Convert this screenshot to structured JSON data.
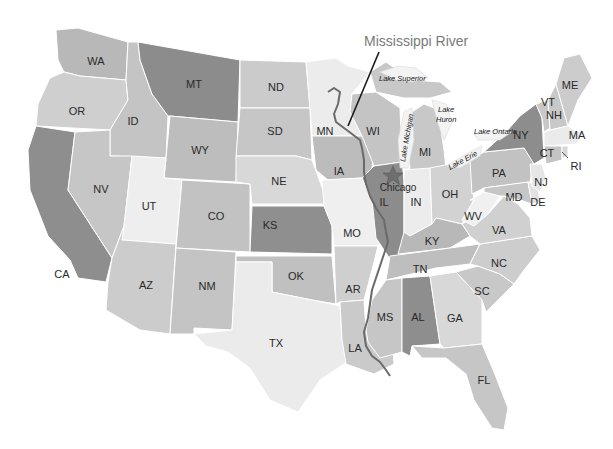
{
  "map": {
    "title": "Mississippi River",
    "city": {
      "name": "Chicago",
      "marker": "star-icon",
      "color": "#6e6e6e"
    },
    "lakes": [
      "Lake Superior",
      "Lake Huron",
      "Lake Michigan",
      "Lake Ontario",
      "Lake Erie"
    ],
    "states": {
      "WA": {
        "label": "WA",
        "fill": "#b8b8b8"
      },
      "OR": {
        "label": "OR",
        "fill": "#cfcfcf"
      },
      "CA": {
        "label": "CA",
        "fill": "#8e8e8e"
      },
      "ID": {
        "label": "ID",
        "fill": "#c4c4c4"
      },
      "NV": {
        "label": "NV",
        "fill": "#c6c6c6"
      },
      "MT": {
        "label": "MT",
        "fill": "#8c8c8c"
      },
      "WY": {
        "label": "WY",
        "fill": "#bdbdbd"
      },
      "UT": {
        "label": "UT",
        "fill": "#eeeeee"
      },
      "AZ": {
        "label": "AZ",
        "fill": "#cccccc"
      },
      "CO": {
        "label": "CO",
        "fill": "#c2c2c2"
      },
      "NM": {
        "label": "NM",
        "fill": "#c4c4c4"
      },
      "ND": {
        "label": "ND",
        "fill": "#cbcbcb"
      },
      "SD": {
        "label": "SD",
        "fill": "#c6c6c6"
      },
      "NE": {
        "label": "NE",
        "fill": "#d8d8d8"
      },
      "KS": {
        "label": "KS",
        "fill": "#8f8f8f"
      },
      "OK": {
        "label": "OK",
        "fill": "#c0c0c0"
      },
      "TX": {
        "label": "TX",
        "fill": "#ebebeb"
      },
      "MN": {
        "label": "MN",
        "fill": "#ececec"
      },
      "IA": {
        "label": "IA",
        "fill": "#bcbcbc"
      },
      "MO": {
        "label": "MO",
        "fill": "#efefef"
      },
      "AR": {
        "label": "AR",
        "fill": "#cfcfcf"
      },
      "LA": {
        "label": "LA",
        "fill": "#cacaca"
      },
      "WI": {
        "label": "WI",
        "fill": "#c4c4c4"
      },
      "IL": {
        "label": "IL",
        "fill": "#8c8c8c"
      },
      "MI": {
        "label": "MI",
        "fill": "#c8c8c8"
      },
      "IN": {
        "label": "IN",
        "fill": "#ececec"
      },
      "OH": {
        "label": "OH",
        "fill": "#d2d2d2"
      },
      "KY": {
        "label": "KY",
        "fill": "#b8b8b8"
      },
      "TN": {
        "label": "TN",
        "fill": "#bebebe"
      },
      "MS": {
        "label": "MS",
        "fill": "#c6c6c6"
      },
      "AL": {
        "label": "AL",
        "fill": "#8e8e8e"
      },
      "GA": {
        "label": "GA",
        "fill": "#d8d8d8"
      },
      "FL": {
        "label": "FL",
        "fill": "#c6c6c6"
      },
      "SC": {
        "label": "SC",
        "fill": "#c8c8c8"
      },
      "NC": {
        "label": "NC",
        "fill": "#cdcdcd"
      },
      "VA": {
        "label": "VA",
        "fill": "#d0d0d0"
      },
      "WV": {
        "label": "WV",
        "fill": "#f0f0f0"
      },
      "PA": {
        "label": "PA",
        "fill": "#c2c2c2"
      },
      "NY": {
        "label": "NY",
        "fill": "#8d8d8d"
      },
      "MD": {
        "label": "MD",
        "fill": "#c6c6c6"
      },
      "DE": {
        "label": "DE",
        "fill": "#e2e2e2"
      },
      "NJ": {
        "label": "NJ",
        "fill": "#e6e6e6"
      },
      "CT": {
        "label": "CT",
        "fill": "#c4c4c4"
      },
      "RI": {
        "label": "RI",
        "fill": "#d6d6d6"
      },
      "MA": {
        "label": "MA",
        "fill": "#ebebeb"
      },
      "VT": {
        "label": "VT",
        "fill": "#c8c8c8"
      },
      "NH": {
        "label": "NH",
        "fill": "#c8c8c8"
      },
      "ME": {
        "label": "ME",
        "fill": "#cccccc"
      }
    }
  }
}
